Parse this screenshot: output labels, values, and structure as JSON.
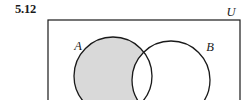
{
  "figure": {
    "exercise_number": "5.12",
    "caption_label": "5.12",
    "type": "venn-diagram",
    "universe": {
      "label": "U",
      "label_name": "universal-set-label",
      "rect": {
        "x": 48,
        "y": 20,
        "width": 192,
        "height": 86
      },
      "stroke": "#1a1a1a",
      "fill": "#ffffff"
    },
    "sets": [
      {
        "key": "A",
        "label": "A",
        "label_name": "set-a-label",
        "cx": 113,
        "cy": 76,
        "r": 39,
        "label_x": 78,
        "label_y": 50,
        "shaded": true
      },
      {
        "key": "B",
        "label": "B",
        "label_name": "set-b-label",
        "cx": 171,
        "cy": 80,
        "r": 39,
        "label_x": 210,
        "label_y": 51,
        "shaded": false
      }
    ],
    "shading": {
      "region": "A \\ B",
      "region_label": "A minus B",
      "fill": "#d9d9d9"
    },
    "colors": {
      "stroke": "#1a1a1a",
      "shade": "#d9d9d9",
      "background": "#ffffff",
      "text": "#1a1a1a"
    }
  }
}
